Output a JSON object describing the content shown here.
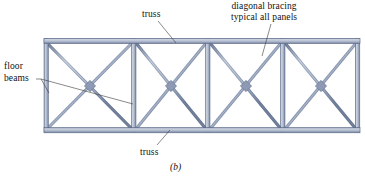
{
  "figure": {
    "caption": "(b)",
    "colors": {
      "member_fill": "#c3cbdb",
      "member_edge": "#5d6b88",
      "member_shade": "#8b97b0",
      "leader_line": "#3a3a3a",
      "text": "#111111",
      "background": "#ffffff"
    },
    "annotations": [
      {
        "id": "truss-top",
        "text": "truss",
        "x": 142,
        "y": 9,
        "leader_from": [
          158,
          22
        ],
        "leader_to": [
          174,
          42
        ]
      },
      {
        "id": "diagonal-bracing",
        "line1": "diagonal bracing",
        "line2": "typical all panels",
        "x": 231,
        "y": 1,
        "leader_from": [
          268,
          24
        ],
        "leader_to": [
          262,
          55
        ]
      },
      {
        "id": "floor-beams",
        "line1": "floor",
        "line2": "beams",
        "x": 4,
        "y": 61,
        "leader_from": [
          40,
          80
        ],
        "leader_to_a": [
          48,
          92
        ],
        "leader_to_b": [
          133,
          104
        ]
      },
      {
        "id": "truss-bottom",
        "text": "truss",
        "x": 140,
        "y": 147,
        "leader_from": [
          156,
          146
        ],
        "leader_to": [
          168,
          131
        ]
      }
    ],
    "truss_geometry": {
      "left": 45,
      "right": 358,
      "top": 40,
      "bottom": 131,
      "chord_thickness": 5,
      "panel_verticals": [
        45,
        134,
        208,
        283,
        358
      ],
      "panel_count": 4,
      "diagonal_pattern": "X-brace-each-panel",
      "cross_centers": [
        [
          90,
          86
        ],
        [
          171,
          86
        ],
        [
          246,
          86
        ],
        [
          321,
          86
        ]
      ]
    }
  }
}
